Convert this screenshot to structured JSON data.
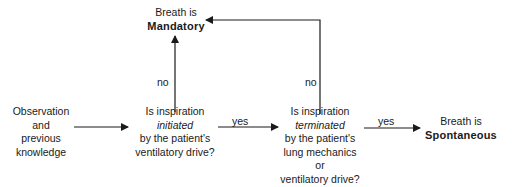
{
  "diagram": {
    "nodes": {
      "start": {
        "lines": [
          "Observation",
          "and",
          "previous",
          "knowledge"
        ]
      },
      "q1": {
        "line1": "Is inspiration",
        "emph": "initiated",
        "line3": "by the patient's",
        "line4": "ventilatory drive?"
      },
      "q2": {
        "line1": "Is inspiration",
        "emph": "terminated",
        "line3": "by the patient's",
        "line4": "lung mechanics",
        "line5": "or",
        "line6": "ventilatory drive?"
      },
      "mandatory": {
        "prefix": "Breath is",
        "result": "Mandatory"
      },
      "spontaneous": {
        "prefix": "Breath is",
        "result": "Spontaneous"
      }
    },
    "edges": {
      "q1_yes": "yes",
      "q1_no": "no",
      "q2_yes": "yes",
      "q2_no": "no"
    },
    "colors": {
      "line": "#1a1a1a",
      "text": "#1a1a1a",
      "background": "#ffffff"
    }
  }
}
